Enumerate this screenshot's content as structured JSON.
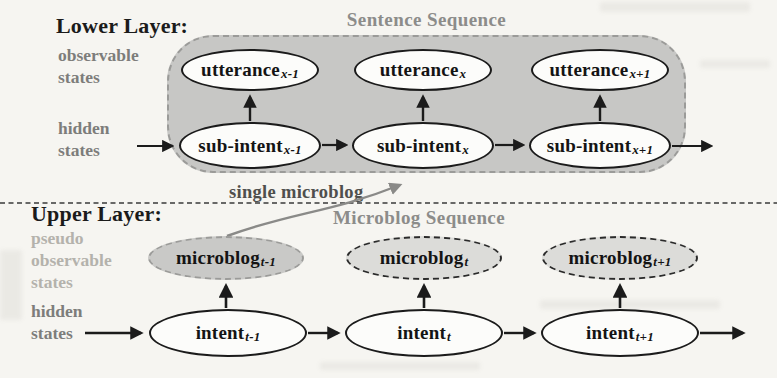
{
  "figure": {
    "lower": {
      "heading": "Lower Layer:",
      "box_title": "Sentence Sequence",
      "observable_label": "observable\nstates",
      "hidden_label": "hidden\nstates",
      "observable_nodes": [
        {
          "base": "utterance",
          "sub": "x-1"
        },
        {
          "base": "utterance",
          "sub": "x"
        },
        {
          "base": "utterance",
          "sub": "x+1"
        }
      ],
      "hidden_nodes": [
        {
          "base": "sub-intent",
          "sub": "x-1"
        },
        {
          "base": "sub-intent",
          "sub": "x"
        },
        {
          "base": "sub-intent",
          "sub": "x+1"
        }
      ]
    },
    "callout": {
      "label": "single microblog"
    },
    "upper": {
      "heading": "Upper Layer:",
      "box_title": "Microblog Sequence",
      "pseudo_observable_label": "pseudo\nobservable\nstates",
      "hidden_label": "hidden\nstates",
      "observable_nodes": [
        {
          "base": "microblog",
          "sub": "t-1"
        },
        {
          "base": "microblog",
          "sub": "t"
        },
        {
          "base": "microblog",
          "sub": "t+1"
        }
      ],
      "hidden_nodes": [
        {
          "base": "intent",
          "sub": "t-1"
        },
        {
          "base": "intent",
          "sub": "t"
        },
        {
          "base": "intent",
          "sub": "t+1"
        }
      ]
    },
    "colors": {
      "sequence_box_fill": "#c7c7c5",
      "dashed_border_gray": "#9b9b99",
      "node_fill_white": "#fcfcfa",
      "microblog_highlight_fill": "#c9c9c7",
      "microblog_fill": "#dcdcd9",
      "gray_label": "#7d7d7b",
      "light_gray_label": "#b4b2ac",
      "title_gray": "#8c8c8a",
      "ink_black": "#1b1b1b"
    }
  }
}
